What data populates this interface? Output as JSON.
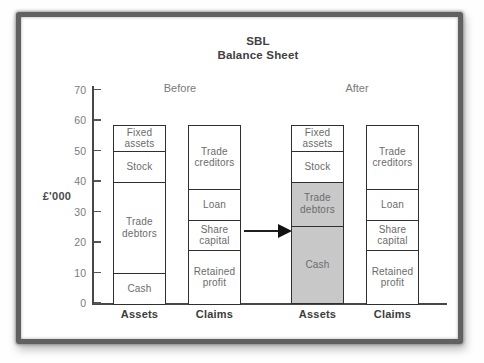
{
  "chart_data": {
    "type": "bar",
    "title": "SBL Balance Sheet",
    "title_lines": [
      "SBL",
      "Balance Sheet"
    ],
    "ylabel": "£'000",
    "ylim": [
      0,
      70
    ],
    "yticks": [
      0,
      10,
      20,
      30,
      40,
      50,
      60,
      70
    ],
    "grid": false,
    "legend": "none",
    "groups": [
      {
        "label": "Before",
        "bars": [
          {
            "category": "Assets",
            "segments": [
              {
                "label": "Cash",
                "value": 10,
                "shaded": false
              },
              {
                "label": "Trade debtors",
                "value": 30,
                "shaded": false
              },
              {
                "label": "Stock",
                "value": 10,
                "shaded": false
              },
              {
                "label": "Fixed assets",
                "value": 8.5,
                "shaded": false
              }
            ]
          },
          {
            "category": "Claims",
            "segments": [
              {
                "label": "Retained profit",
                "value": 17.5,
                "shaded": false
              },
              {
                "label": "Share capital",
                "value": 10,
                "shaded": false
              },
              {
                "label": "Loan",
                "value": 10,
                "shaded": false
              },
              {
                "label": "Trade creditors",
                "value": 21,
                "shaded": false
              }
            ]
          }
        ]
      },
      {
        "label": "After",
        "bars": [
          {
            "category": "Assets",
            "segments": [
              {
                "label": "Cash",
                "value": 25.5,
                "shaded": true
              },
              {
                "label": "Trade debtors",
                "value": 14.5,
                "shaded": true
              },
              {
                "label": "Stock",
                "value": 10,
                "shaded": false
              },
              {
                "label": "Fixed assets",
                "value": 8.5,
                "shaded": false
              }
            ]
          },
          {
            "category": "Claims",
            "segments": [
              {
                "label": "Retained profit",
                "value": 17.5,
                "shaded": false
              },
              {
                "label": "Share capital",
                "value": 10,
                "shaded": false
              },
              {
                "label": "Loan",
                "value": 10,
                "shaded": false
              },
              {
                "label": "Trade creditors",
                "value": 21,
                "shaded": false
              }
            ]
          }
        ]
      }
    ],
    "annotations": [
      {
        "type": "arrow",
        "direction": "right",
        "between": [
          "Before Claims bar",
          "After Assets bar"
        ]
      }
    ],
    "colors": {
      "shaded_fill": "#c8c8c8",
      "box_fill": "#ffffff",
      "box_border": "#2f2f2f",
      "axis": "#474747",
      "segment_text": "#6b6b6b",
      "tick_text": "#7b7b7b"
    }
  }
}
